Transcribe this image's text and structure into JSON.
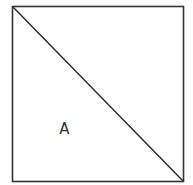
{
  "diagram": {
    "shape": "square",
    "stroke_color": "#333333",
    "square": {
      "x": 12.5,
      "y": 6.5,
      "width": 171,
      "height": 175
    },
    "diagonal": {
      "from": "top-left",
      "to": "bottom-right"
    },
    "region_label": "A",
    "label_position": {
      "x": 64.5,
      "y": 134
    }
  }
}
